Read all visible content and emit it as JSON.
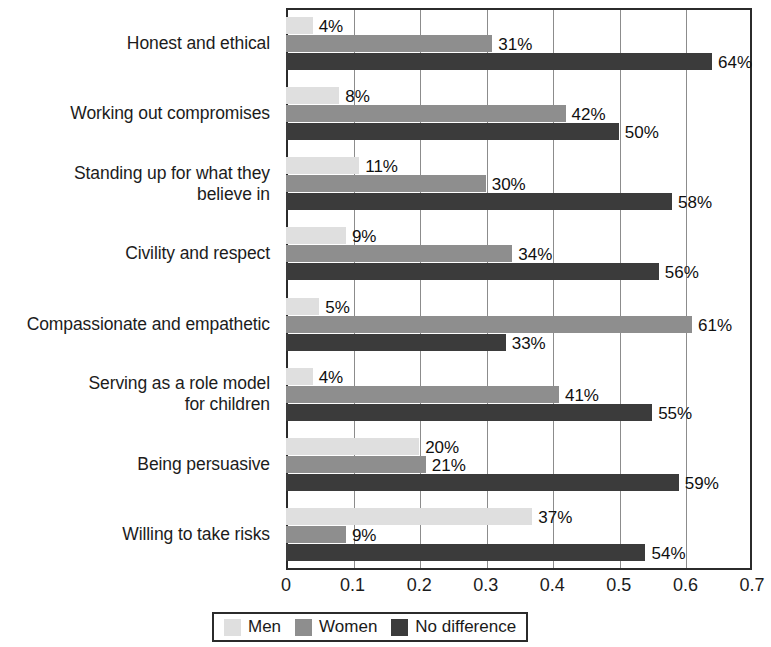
{
  "chart_data": {
    "type": "bar",
    "orientation": "horizontal",
    "title": "",
    "subtitle": "",
    "xlabel": "",
    "ylabel": "",
    "xlim": [
      0,
      0.7
    ],
    "xticks": [
      "0",
      "0.1",
      "0.2",
      "0.3",
      "0.4",
      "0.5",
      "0.6",
      "0.7"
    ],
    "xtick_values": [
      0,
      0.1,
      0.2,
      0.3,
      0.4,
      0.5,
      0.6,
      0.7
    ],
    "grid": "vertical",
    "legend_position": "bottom",
    "categories": [
      "Honest and ethical",
      "Working out compromises",
      "Standing up for what they believe in",
      "Civility and respect",
      "Compassionate and empathetic",
      "Serving as a role model for children",
      "Being persuasive",
      "Willing to take risks"
    ],
    "category_lines": [
      [
        "Honest and ethical"
      ],
      [
        "Working out compromises"
      ],
      [
        "Standing up for what they",
        "believe in"
      ],
      [
        "Civility and respect"
      ],
      [
        "Compassionate and empathetic"
      ],
      [
        "Serving as a role model",
        "for children"
      ],
      [
        "Being persuasive"
      ],
      [
        "Willing to take risks"
      ]
    ],
    "series": [
      {
        "name": "Men",
        "color": "#dfdfdf",
        "values": [
          0.04,
          0.08,
          0.11,
          0.09,
          0.05,
          0.04,
          0.2,
          0.37
        ],
        "labels": [
          "4%",
          "8%",
          "11%",
          "9%",
          "5%",
          "4%",
          "20%",
          "37%"
        ]
      },
      {
        "name": "Women",
        "color": "#8e8e8e",
        "values": [
          0.31,
          0.42,
          0.3,
          0.34,
          0.61,
          0.41,
          0.21,
          0.09
        ],
        "labels": [
          "31%",
          "42%",
          "30%",
          "34%",
          "61%",
          "41%",
          "21%",
          "9%"
        ]
      },
      {
        "name": "No difference",
        "color": "#3b3b3b",
        "values": [
          0.64,
          0.5,
          0.58,
          0.56,
          0.33,
          0.55,
          0.59,
          0.54
        ],
        "labels": [
          "64%",
          "50%",
          "58%",
          "56%",
          "33%",
          "55%",
          "59%",
          "54%"
        ]
      }
    ]
  },
  "legend": {
    "items": [
      {
        "label": "Men",
        "color": "#dfdfdf"
      },
      {
        "label": "Women",
        "color": "#8e8e8e"
      },
      {
        "label": "No difference",
        "color": "#3b3b3b"
      }
    ]
  },
  "colors": {
    "men": "#dfdfdf",
    "women": "#8e8e8e",
    "no_difference": "#3b3b3b",
    "axis": "#2b2b2b",
    "grid": "#8c8c8c",
    "text": "#1a1a1a",
    "background": "#ffffff"
  }
}
